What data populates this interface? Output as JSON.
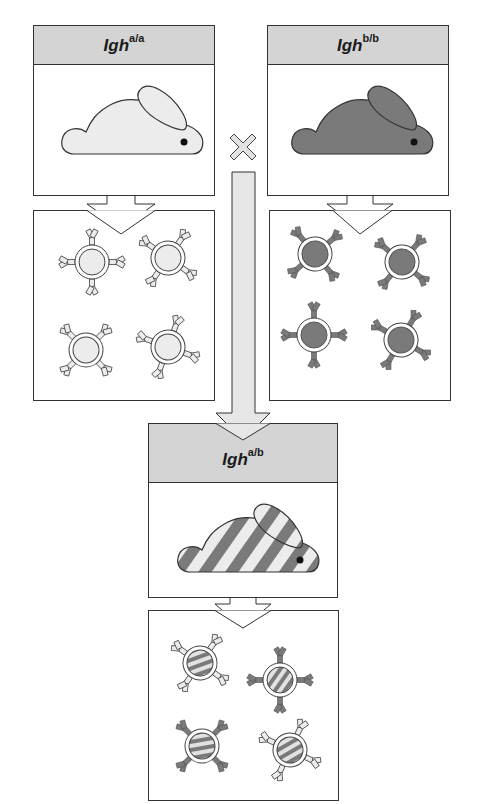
{
  "colors": {
    "header_fill": "#d4d4d4",
    "light_fill": "#ececec",
    "dark_fill": "#7a7a7a",
    "outline": "#333333",
    "arrow_fill": "#e6e6e6"
  },
  "parents": [
    {
      "id": "parent-a",
      "gene": "Igh",
      "genotype": "a/a",
      "rabbit_color": "light",
      "cell_allotype": "light"
    },
    {
      "id": "parent-b",
      "gene": "Igh",
      "genotype": "b/b",
      "rabbit_color": "dark",
      "cell_allotype": "dark"
    }
  ],
  "cross_symbol": "×",
  "offspring": {
    "id": "offspring-ab",
    "gene": "Igh",
    "genotype": "a/b",
    "rabbit_color": "striped",
    "cells": [
      "light",
      "dark",
      "dark",
      "light"
    ]
  },
  "cells_per_panel": 4
}
